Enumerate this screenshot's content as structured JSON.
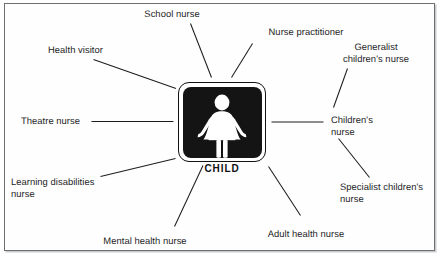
{
  "figure": {
    "type": "radial-spoke-diagram",
    "center": {
      "icon_name": "child-pictogram",
      "caption": "CHILD"
    },
    "colors": {
      "ink": "#1d1d1f",
      "icon_fill": "#141414",
      "icon_glyph": "#ffffff",
      "frame_border": "#6d6f73",
      "page_background": "#ffffff"
    },
    "nodes": [
      {
        "id": "school-nurse",
        "label": "School nurse",
        "position": "top",
        "lines": 1
      },
      {
        "id": "nurse-practitioner",
        "label": "Nurse practitioner",
        "position": "top-right",
        "lines": 1
      },
      {
        "id": "generalist-childrens-nurse",
        "label": "Generalist\nchildren's nurse",
        "position": "right-upper",
        "lines": 2
      },
      {
        "id": "childrens-nurse",
        "label": "Children's\nnurse",
        "position": "right",
        "lines": 2
      },
      {
        "id": "specialist-childrens-nurse",
        "label": "Specialist children's\nnurse",
        "position": "right-lower",
        "lines": 2
      },
      {
        "id": "adult-health-nurse",
        "label": "Adult health nurse",
        "position": "bottom-right",
        "lines": 1
      },
      {
        "id": "mental-health-nurse",
        "label": "Mental health nurse",
        "position": "bottom",
        "lines": 1
      },
      {
        "id": "learning-disabilities-nurse",
        "label": "Learning disabilities\nnurse",
        "position": "bottom-left",
        "lines": 2
      },
      {
        "id": "theatre-nurse",
        "label": "Theatre nurse",
        "position": "left",
        "lines": 1
      },
      {
        "id": "health-visitor",
        "label": "Health visitor",
        "position": "top-left",
        "lines": 1
      }
    ]
  }
}
